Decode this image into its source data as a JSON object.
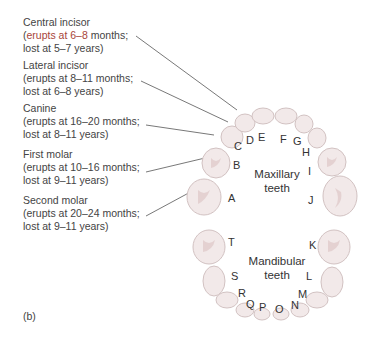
{
  "labels": [
    {
      "name": "Central incisor",
      "line1_pre": "(",
      "line1_hl": "erupts at 6–8",
      "line1_post": " months;",
      "line2": "lost at 5–7 years)"
    },
    {
      "name": "Lateral incisor",
      "line1_pre": "(erupts at 8–11 months;",
      "line1_hl": "",
      "line1_post": "",
      "line2": "lost at 6–8 years)"
    },
    {
      "name": "Canine",
      "line1_pre": "(erupts at 16–20 months;",
      "line1_hl": "",
      "line1_post": "",
      "line2": "lost at 8–11 years)"
    },
    {
      "name": "First molar",
      "line1_pre": "(erupts at 10–16 months;",
      "line1_hl": "",
      "line1_post": "",
      "line2": "lost at 9–11 years)"
    },
    {
      "name": "Second molar",
      "line1_pre": "(erupts at 20–24 months;",
      "line1_hl": "",
      "line1_post": "",
      "line2": "lost at 9–11 years)"
    }
  ],
  "maxillary": {
    "title_line1": "Maxillary",
    "title_line2": "teeth",
    "letters": [
      "A",
      "B",
      "C",
      "D",
      "E",
      "F",
      "G",
      "H",
      "I",
      "J"
    ]
  },
  "mandibular": {
    "title_line1": "Mandibular",
    "title_line2": "teeth",
    "letters": [
      "K",
      "L",
      "M",
      "N",
      "O",
      "P",
      "Q",
      "R",
      "S",
      "T"
    ]
  },
  "caption": "(b)",
  "colors": {
    "highlight": "#a8453a",
    "tooth_fill": "#f1e8e8",
    "tooth_stroke": "#cdbcbc",
    "leader": "#555555"
  }
}
